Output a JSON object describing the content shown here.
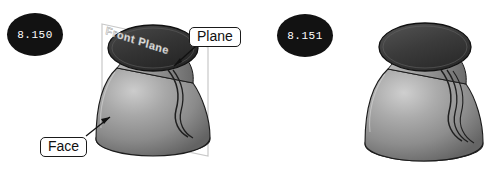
{
  "figure_set": {
    "background_color": "#ffffff",
    "figures": [
      {
        "badge_label": "8.150",
        "badge_color": "#121212",
        "badge_text_color": "#ffffff",
        "plane_name": "Front Plane",
        "callouts": [
          {
            "label": "Plane",
            "target": "reference-plane"
          },
          {
            "label": "Face",
            "target": "revolved-face"
          }
        ],
        "model": {
          "name": "revolved-vase-with-plane",
          "body_color": "#8e8e8e",
          "body_highlight": "#c9c9c9",
          "body_shadow": "#5c5c5c",
          "rim_color": "#3a3a3a",
          "outline_color": "#1a1a1a",
          "plane_outline_color": "#c2c2c2"
        }
      },
      {
        "badge_label": "8.151",
        "badge_color": "#121212",
        "badge_text_color": "#ffffff",
        "plane_name": "",
        "callouts": [],
        "model": {
          "name": "revolved-vase-plain",
          "body_color": "#8e8e8e",
          "body_highlight": "#c9c9c9",
          "body_shadow": "#5c5c5c",
          "rim_color": "#3a3a3a",
          "outline_color": "#1a1a1a",
          "plane_outline_color": ""
        }
      }
    ]
  }
}
